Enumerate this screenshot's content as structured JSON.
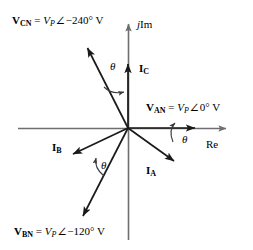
{
  "figure": {
    "type": "phasor-diagram",
    "title": "",
    "axes": {
      "real": {
        "label": "Re",
        "label_x": 208,
        "label_y": 140
      },
      "imag": {
        "label_j": "j",
        "label_im": "Im",
        "label_x": 138,
        "label_y": 20
      }
    },
    "origin": {
      "x": 128,
      "y": 128
    },
    "voltage_phasors": [
      {
        "name": "V_AN",
        "bold_symbol": "V",
        "subscript": "AN",
        "magnitude": "V",
        "magnitude_sub": "P",
        "angle_text": "0°",
        "unit": "V",
        "angle_deg": 0,
        "label_x": 146,
        "label_y": 101
      },
      {
        "name": "V_BN",
        "bold_symbol": "V",
        "subscript": "BN",
        "magnitude": "V",
        "magnitude_sub": "P",
        "angle_text": "−120°",
        "unit": "V",
        "angle_deg": -120,
        "label_x": 14,
        "label_y": 225
      },
      {
        "name": "V_CN",
        "bold_symbol": "V",
        "subscript": "CN",
        "magnitude": "V",
        "magnitude_sub": "P",
        "angle_text": "−240°",
        "unit": "V",
        "angle_deg": -240,
        "label_x": 12,
        "label_y": 15
      }
    ],
    "current_phasors": [
      {
        "name": "I_A",
        "bold_symbol": "I",
        "subscript": "A",
        "label_x": 147,
        "label_y": 166
      },
      {
        "name": "I_B",
        "bold_symbol": "I",
        "subscript": "B",
        "label_x": 53,
        "label_y": 143
      },
      {
        "name": "I_C",
        "bold_symbol": "I",
        "subscript": "C",
        "label_x": 140,
        "label_y": 64
      }
    ],
    "angle_marks": [
      {
        "name": "theta-a",
        "label": "θ",
        "label_x": 172,
        "label_y": 136
      },
      {
        "name": "theta-b",
        "label": "θ",
        "label_x": 99,
        "label_y": 161
      },
      {
        "name": "theta-c",
        "label": "θ",
        "label_x": 109,
        "label_y": 62
      }
    ],
    "colors": {
      "axis": "#6e6e6e",
      "vector": "#1a1a1a",
      "arc": "#3a3a3a",
      "text": "#000000",
      "background": "#ffffff"
    }
  }
}
